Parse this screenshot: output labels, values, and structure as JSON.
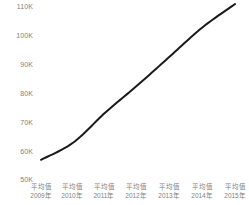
{
  "chart_data": {
    "type": "line",
    "title": "",
    "subtitle": "",
    "xlabel": "",
    "ylabel": "",
    "categories": [
      "平均值\n2009年",
      "平均值\n2010年",
      "平均值\n2011年",
      "平均值\n2012年",
      "平均值\n2013年",
      "平均值\n2014年",
      "平均值\n2015年"
    ],
    "category_lines": [
      {
        "stat": "平均值",
        "year": "2009年"
      },
      {
        "stat": "平均值",
        "year": "2010年"
      },
      {
        "stat": "平均值",
        "year": "2011年"
      },
      {
        "stat": "平均值",
        "year": "2012年"
      },
      {
        "stat": "平均值",
        "year": "2013年"
      },
      {
        "stat": "平均值",
        "year": "2014年"
      },
      {
        "stat": "平均值",
        "year": "2015年"
      }
    ],
    "series": [
      {
        "name": "平均值",
        "values": [
          57000,
          63000,
          73500,
          83000,
          93000,
          103000,
          111000
        ],
        "color": "#1a1a1a"
      }
    ],
    "ylim": [
      50000,
      110000
    ],
    "ytick_values": [
      110000,
      100000,
      90000,
      80000,
      70000,
      60000,
      50000
    ],
    "ytick_labels": [
      "110K",
      "100K",
      "90K",
      "80K",
      "70K",
      "60K",
      "50K"
    ],
    "grid": false,
    "legend": false,
    "markers": false,
    "axis_label_color": "#7f7f7f",
    "line_color": "#1a1a1a",
    "background_color": "#ffffff"
  }
}
